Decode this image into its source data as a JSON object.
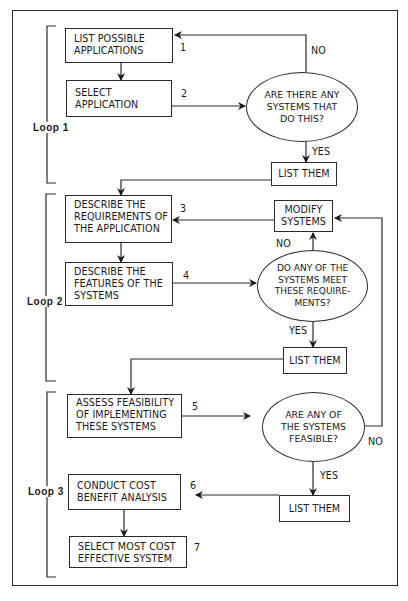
{
  "diagram": {
    "type": "flowchart",
    "loops": [
      {
        "label": "Loop 1"
      },
      {
        "label": "Loop 2"
      },
      {
        "label": "Loop 3"
      }
    ],
    "steps": [
      {
        "number": "1",
        "text": "LIST POSSIBLE\nAPPLICATIONS"
      },
      {
        "number": "2",
        "text": "SELECT\nAPPLICATION"
      },
      {
        "number": "3",
        "text": "DESCRIBE THE\nREQUIREMENTS OF\nTHE APPLICATION"
      },
      {
        "number": "4",
        "text": "DESCRIBE THE\nFEATURES OF THE\nSYSTEMS"
      },
      {
        "number": "5",
        "text": "ASSESS FEASIBILITY\nOF IMPLEMENTING\nTHESE SYSTEMS"
      },
      {
        "number": "6",
        "text": "CONDUCT COST\nBENEFIT ANALYSIS"
      },
      {
        "number": "7",
        "text": "SELECT MOST COST\nEFFECTIVE SYSTEM"
      }
    ],
    "decisions": [
      {
        "text": "ARE THERE ANY\nSYSTEMS THAT\nDO THIS?",
        "yes": "YES",
        "no": "NO"
      },
      {
        "text": "DO ANY OF THE\nSYSTEMS MEET\nTHESE REQUIRE-\nMENTS?",
        "yes": "YES",
        "no": "NO"
      },
      {
        "text": "ARE ANY OF\nTHE SYSTEMS\nFEASIBLE?",
        "yes": "YES",
        "no": "NO"
      }
    ],
    "outputs": [
      {
        "text": "LIST THEM"
      },
      {
        "text": "LIST THEM"
      },
      {
        "text": "LIST THEM"
      }
    ],
    "modify": {
      "text": "MODIFY\nSYSTEMS"
    }
  }
}
